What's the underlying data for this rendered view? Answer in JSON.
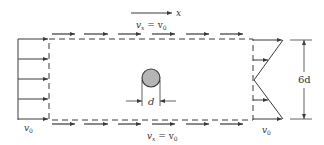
{
  "diagram": {
    "type": "fluid-flow control volume around a cylinder",
    "colors": {
      "line": "#3a3a3a",
      "cylinder_fill": "#b5b5b5",
      "background": "#ffffff"
    },
    "axis": {
      "label": "x"
    },
    "labels": {
      "top_velocity_var": "v",
      "top_velocity_sub": "x",
      "top_velocity_eq": " = v",
      "top_velocity_eq_sub": "0",
      "bottom_velocity_var": "v",
      "bottom_velocity_sub": "x",
      "bottom_velocity_eq": " = v",
      "bottom_velocity_eq_sub": "0",
      "inlet_velocity": "v",
      "inlet_velocity_sub": "0",
      "outlet_velocity": "v",
      "outlet_velocity_sub": "0",
      "cylinder_diameter": "d",
      "height_dimension": "6d"
    },
    "elements": {
      "inlet_profile": "uniform velocity profile, 5 arrows",
      "outlet_profile": "linear wake profile, V-shaped with minimum at centerline",
      "control_volume": "dashed rectangle",
      "cylinder": "shaded circle of diameter d at center"
    }
  }
}
